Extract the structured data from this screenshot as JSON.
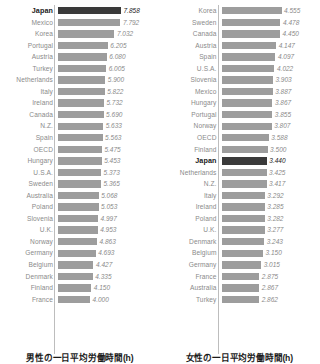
{
  "chart_data": [
    {
      "type": "bar",
      "orientation": "horizontal",
      "title": "男性の一日平均労働時間(h)",
      "xlabel": "",
      "ylabel": "",
      "unit": "h",
      "highlight": "Japan",
      "highlight_color": "#3a3a3a",
      "bar_color": "#9d9d9d",
      "xlim": [
        0,
        7.858
      ],
      "grid": false,
      "legend": false,
      "categories": [
        "Japan",
        "Mexico",
        "Korea",
        "Portugal",
        "Austria",
        "Turkey",
        "Netherlands",
        "Italy",
        "Ireland",
        "Canada",
        "N.Z.",
        "Spain",
        "OECD",
        "Hungary",
        "U.S.A.",
        "Sweden",
        "Australia",
        "Poland",
        "Slovenia",
        "U.K.",
        "Norway",
        "Germany",
        "Belgium",
        "Denmark",
        "Finland",
        "France"
      ],
      "values": [
        7.858,
        7.792,
        7.032,
        6.205,
        6.08,
        6.005,
        5.9,
        5.822,
        5.732,
        5.69,
        5.633,
        5.563,
        5.475,
        5.453,
        5.373,
        5.365,
        5.068,
        5.053,
        4.997,
        4.953,
        4.863,
        4.693,
        4.427,
        4.335,
        4.15,
        4.0
      ],
      "value_labels": [
        "7.858",
        "7.792",
        "7.032",
        "6.205",
        "6.080",
        "6.005",
        "5.900",
        "5.822",
        "5.732",
        "5.690",
        "5.633",
        "5.563",
        "5.475",
        "5.453",
        "5.373",
        "5.365",
        "5.068",
        "5.053",
        "4.997",
        "4.953",
        "4.863",
        "4.693",
        "4.427",
        "4.335",
        "4.150",
        "4.000"
      ]
    },
    {
      "type": "bar",
      "orientation": "horizontal",
      "title": "女性の一日平均労働時間(h)",
      "xlabel": "",
      "ylabel": "",
      "unit": "h",
      "highlight": "Japan",
      "highlight_color": "#3a3a3a",
      "bar_color": "#9d9d9d",
      "xlim": [
        0,
        4.555
      ],
      "grid": false,
      "legend": false,
      "categories": [
        "Korea",
        "Sweden",
        "Canada",
        "Austria",
        "Spain",
        "U.S.A.",
        "Slovenia",
        "Mexico",
        "Hungary",
        "Portugal",
        "Norway",
        "OECD",
        "Finland",
        "Japan",
        "Netherlands",
        "N.Z.",
        "Italy",
        "Ireland",
        "Poland",
        "U.K.",
        "Denmark",
        "Belgium",
        "Germany",
        "France",
        "Australia",
        "Turkey"
      ],
      "values": [
        4.555,
        4.478,
        4.45,
        4.147,
        4.097,
        4.022,
        3.903,
        3.887,
        3.867,
        3.855,
        3.807,
        3.588,
        3.5,
        3.44,
        3.425,
        3.417,
        3.292,
        3.285,
        3.282,
        3.277,
        3.243,
        3.15,
        3.015,
        2.875,
        2.867,
        2.862
      ],
      "value_labels": [
        "4.555",
        "4.478",
        "4.450",
        "4.147",
        "4.097",
        "4.022",
        "3.903",
        "3.887",
        "3.867",
        "3.855",
        "3.807",
        "3.588",
        "3.500",
        "3.440",
        "3.425",
        "3.417",
        "3.292",
        "3.285",
        "3.282",
        "3.277",
        "3.243",
        "3.150",
        "3.015",
        "2.875",
        "2.867",
        "2.862"
      ]
    }
  ]
}
